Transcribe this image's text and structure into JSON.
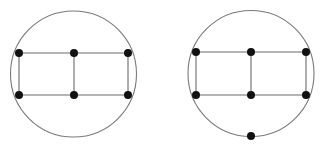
{
  "colors": {
    "background": "#ffffff",
    "edge": "#6a6a6a",
    "circle": "#7a7a7a",
    "vertex": "#111111"
  },
  "graphs": [
    {
      "name": "left-graph",
      "circle": {
        "cx": 73.5,
        "cy": 74,
        "r": 63
      },
      "vertices": [
        {
          "id": "a",
          "x": 19,
          "y": 53
        },
        {
          "id": "b",
          "x": 74,
          "y": 53
        },
        {
          "id": "c",
          "x": 128,
          "y": 53
        },
        {
          "id": "d",
          "x": 19,
          "y": 95
        },
        {
          "id": "e",
          "x": 74,
          "y": 95
        },
        {
          "id": "f",
          "x": 128,
          "y": 95
        }
      ],
      "edges": [
        [
          "a",
          "b"
        ],
        [
          "b",
          "c"
        ],
        [
          "d",
          "e"
        ],
        [
          "e",
          "f"
        ],
        [
          "a",
          "d"
        ],
        [
          "b",
          "e"
        ],
        [
          "c",
          "f"
        ]
      ]
    },
    {
      "name": "right-graph",
      "circle": {
        "cx": 251,
        "cy": 73.5,
        "r": 63
      },
      "vertices": [
        {
          "id": "a",
          "x": 196,
          "y": 52
        },
        {
          "id": "b",
          "x": 251,
          "y": 52
        },
        {
          "id": "c",
          "x": 306,
          "y": 52
        },
        {
          "id": "d",
          "x": 196,
          "y": 95
        },
        {
          "id": "e",
          "x": 251,
          "y": 95
        },
        {
          "id": "f",
          "x": 306,
          "y": 95
        },
        {
          "id": "g",
          "x": 251,
          "y": 136
        }
      ],
      "edges": [
        [
          "a",
          "b"
        ],
        [
          "b",
          "c"
        ],
        [
          "d",
          "e"
        ],
        [
          "e",
          "f"
        ],
        [
          "a",
          "d"
        ],
        [
          "b",
          "e"
        ],
        [
          "c",
          "f"
        ]
      ]
    }
  ],
  "vertex_radius": 4
}
